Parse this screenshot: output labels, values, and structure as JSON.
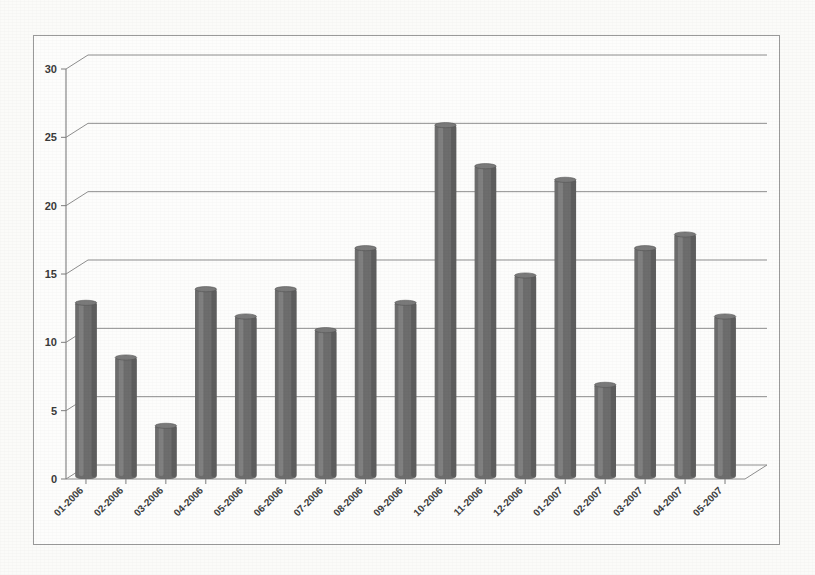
{
  "chart_data": {
    "type": "bar",
    "title": "",
    "subtitle": "",
    "xlabel": "",
    "ylabel": "",
    "categories": [
      "01-2006",
      "02-2006",
      "03-2006",
      "04-2006",
      "05-2006",
      "06-2006",
      "07-2006",
      "08-2006",
      "09-2006",
      "10-2006",
      "11-2006",
      "12-2006",
      "01-2007",
      "02-2007",
      "03-2007",
      "04-2007",
      "05-2007"
    ],
    "values": [
      13,
      9,
      4,
      14,
      12,
      14,
      11,
      17,
      13,
      26,
      23,
      15,
      22,
      7,
      17,
      18,
      12
    ],
    "ylim": [
      0,
      30
    ],
    "ytick_labels": [
      "0",
      "5",
      "10",
      "15",
      "20",
      "25",
      "30"
    ],
    "ytick_values": [
      0,
      5,
      10,
      15,
      20,
      25,
      30
    ],
    "grid": true,
    "legend": "none",
    "style": "3d-cylinder-bars",
    "bar_color": "#6d6d6d",
    "grid_color": "#8e8e8e",
    "axis_color": "#7d7d7d",
    "background_color": "#fdfdfc"
  }
}
